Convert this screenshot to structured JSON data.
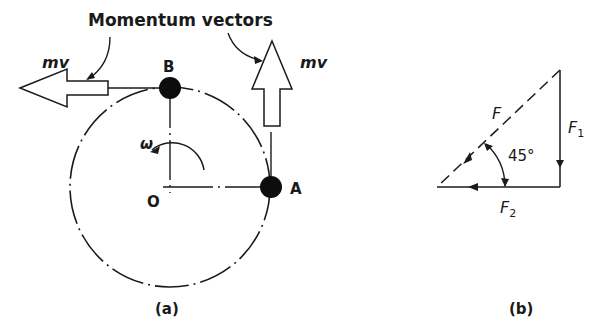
{
  "figure_a": {
    "title": "Momentum vectors",
    "momentum_left_label": "mv",
    "momentum_up_label": "mv",
    "point_b": "B",
    "point_a": "A",
    "center": "O",
    "angular_velocity": "ω",
    "caption": "(a)"
  },
  "figure_b": {
    "resultant": "F",
    "vertical_component": "F",
    "vertical_subscript": "1",
    "horizontal_component": "F",
    "horizontal_subscript": "2",
    "angle": "45°",
    "caption": "(b)"
  },
  "colors": {
    "ink": "#1a1a1a",
    "background": "#ffffff"
  }
}
